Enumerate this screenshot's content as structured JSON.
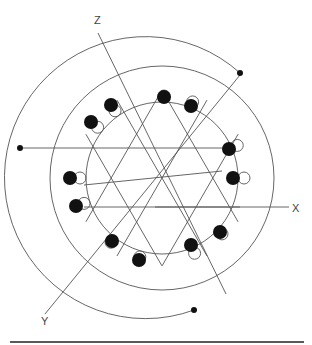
{
  "diagram": {
    "type": "winding-diagram",
    "axes": [
      {
        "label": "Z",
        "from": [
          98,
          33
        ],
        "to": [
          226,
          294
        ],
        "label_pos": [
          94,
          24
        ]
      },
      {
        "label": "X",
        "from": [
          155,
          207
        ],
        "to": [
          289,
          207
        ],
        "label_pos": [
          292,
          212
        ]
      },
      {
        "label": "Y",
        "from": [
          240,
          75
        ],
        "to": [
          45,
          314
        ],
        "label_pos": [
          41,
          325
        ]
      }
    ],
    "center": [
      162,
      178
    ],
    "inner_circle_radius": 76,
    "arcs": [
      {
        "name": "outer-arc",
        "radius": 141,
        "from_deg": 180,
        "to_deg": 488,
        "end_dots": [
          [
            20,
            148
          ],
          [
            194,
            310
          ]
        ]
      },
      {
        "name": "middle-arc",
        "radius": 112,
        "from_deg": 0,
        "to_deg": 360
      }
    ],
    "top_horizontal": {
      "from": [
        20,
        148
      ],
      "to": [
        236,
        148
      ]
    },
    "end_dot_top_right": [
      240,
      73
    ],
    "coil_dots": [
      [
        164,
        97
      ],
      [
        191,
        106
      ],
      [
        111,
        105
      ],
      [
        91,
        122
      ],
      [
        229,
        149
      ],
      [
        233,
        178
      ],
      [
        70,
        178
      ],
      [
        76,
        206
      ],
      [
        220,
        232
      ],
      [
        191,
        245
      ],
      [
        112,
        241
      ],
      [
        139,
        260
      ]
    ],
    "bottom_rule": {
      "from": [
        10,
        342
      ],
      "to": [
        304,
        342
      ]
    }
  }
}
